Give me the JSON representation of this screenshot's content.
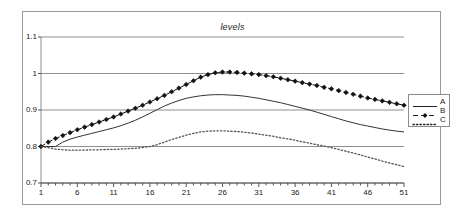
{
  "chart_data": {
    "type": "line",
    "title": "levels",
    "xlabel": "",
    "ylabel": "",
    "xlim": [
      1,
      51
    ],
    "ylim": [
      0.7,
      1.1
    ],
    "grid": true,
    "grid_axis": "y",
    "legend_position": "right",
    "ytick_labels": [
      "1.1",
      "1",
      "0.9",
      "0.8",
      "0.7"
    ],
    "ytick_values": [
      1.1,
      1.0,
      0.9,
      0.8,
      0.7
    ],
    "xtick_labels": [
      "1",
      "6",
      "11",
      "16",
      "21",
      "26",
      "31",
      "36",
      "41",
      "46",
      "51"
    ],
    "xtick_values": [
      1,
      6,
      11,
      16,
      21,
      26,
      31,
      36,
      41,
      46,
      51
    ],
    "minor_xticks_step": 1,
    "x": [
      1,
      2,
      3,
      4,
      5,
      6,
      7,
      8,
      9,
      10,
      11,
      12,
      13,
      14,
      15,
      16,
      17,
      18,
      19,
      20,
      21,
      22,
      23,
      24,
      25,
      26,
      27,
      28,
      29,
      30,
      31,
      32,
      33,
      34,
      35,
      36,
      37,
      38,
      39,
      40,
      41,
      42,
      43,
      44,
      45,
      46,
      47,
      48,
      49,
      50,
      51
    ],
    "series": [
      {
        "name": "A",
        "style": "solid",
        "marker": "none",
        "color": "#333333",
        "values": [
          0.8,
          0.8,
          0.8,
          0.812,
          0.82,
          0.826,
          0.831,
          0.836,
          0.841,
          0.846,
          0.851,
          0.857,
          0.864,
          0.872,
          0.881,
          0.891,
          0.901,
          0.911,
          0.919,
          0.926,
          0.932,
          0.936,
          0.939,
          0.941,
          0.942,
          0.942,
          0.941,
          0.94,
          0.938,
          0.935,
          0.932,
          0.928,
          0.924,
          0.92,
          0.915,
          0.91,
          0.905,
          0.9,
          0.894,
          0.888,
          0.882,
          0.876,
          0.87,
          0.865,
          0.86,
          0.856,
          0.852,
          0.848,
          0.845,
          0.842,
          0.84
        ]
      },
      {
        "name": "B",
        "style": "dashed",
        "marker": "diamond",
        "color": "#111111",
        "values": [
          0.8,
          0.812,
          0.822,
          0.83,
          0.838,
          0.846,
          0.853,
          0.86,
          0.867,
          0.874,
          0.881,
          0.889,
          0.897,
          0.905,
          0.913,
          0.922,
          0.931,
          0.94,
          0.95,
          0.96,
          0.97,
          0.98,
          0.99,
          0.997,
          1.002,
          1.004,
          1.004,
          1.003,
          1.001,
          0.999,
          0.997,
          0.994,
          0.991,
          0.987,
          0.983,
          0.979,
          0.975,
          0.971,
          0.967,
          0.962,
          0.958,
          0.953,
          0.948,
          0.943,
          0.938,
          0.933,
          0.929,
          0.925,
          0.921,
          0.917,
          0.913
        ]
      },
      {
        "name": "C",
        "style": "dotted",
        "marker": "none",
        "color": "#555555",
        "values": [
          0.8,
          0.797,
          0.793,
          0.791,
          0.79,
          0.79,
          0.79,
          0.791,
          0.791,
          0.792,
          0.792,
          0.793,
          0.794,
          0.795,
          0.797,
          0.8,
          0.805,
          0.812,
          0.819,
          0.825,
          0.831,
          0.836,
          0.84,
          0.842,
          0.843,
          0.843,
          0.842,
          0.841,
          0.839,
          0.837,
          0.834,
          0.831,
          0.828,
          0.824,
          0.821,
          0.817,
          0.813,
          0.809,
          0.805,
          0.801,
          0.797,
          0.792,
          0.787,
          0.782,
          0.777,
          0.771,
          0.766,
          0.76,
          0.755,
          0.75,
          0.745
        ]
      }
    ],
    "legend": [
      {
        "label": "A",
        "style": "solid",
        "marker": "none"
      },
      {
        "label": "B",
        "style": "dashed",
        "marker": "diamond"
      },
      {
        "label": "C",
        "style": "dotted",
        "marker": "none"
      }
    ]
  }
}
